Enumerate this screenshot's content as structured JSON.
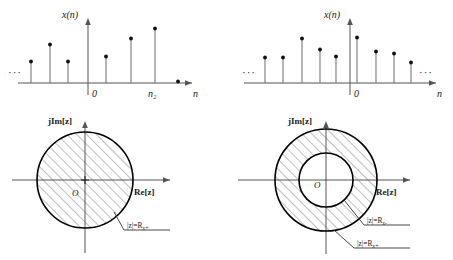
{
  "figure": {
    "panels": [
      {
        "id": "left-sequence",
        "kind": "stem-plot",
        "y_axis_label": "x(n)",
        "x_axis_label": "n",
        "origin_label": "0",
        "marker_label": "n₂",
        "left_ellipsis": "···",
        "right_ellipsis": "",
        "samples": [
          {
            "n": -5,
            "value": 0.34
          },
          {
            "n": -4,
            "value": 0.62
          },
          {
            "n": -3,
            "value": 0.34
          },
          {
            "n": -1,
            "value": 0.0
          },
          {
            "n": 1,
            "value": 0.42
          },
          {
            "n": 2,
            "value": 0.72
          },
          {
            "n": 3,
            "value": 0.88
          },
          {
            "n": 4,
            "value": 0.03
          }
        ]
      },
      {
        "id": "left-roc",
        "kind": "z-plane",
        "imag_axis_label": "jIm[z]",
        "real_axis_label": "Re[z]",
        "origin_label": "O",
        "region_type": "disk",
        "boundary_labels": [
          {
            "text": "|z|=R",
            "sub": "x+"
          }
        ]
      },
      {
        "id": "right-sequence",
        "kind": "stem-plot",
        "y_axis_label": "x(n)",
        "x_axis_label": "n",
        "origin_label": "0",
        "marker_label": "",
        "left_ellipsis": "···",
        "right_ellipsis": "···",
        "samples": [
          {
            "n": -6,
            "value": 0.44
          },
          {
            "n": -5,
            "value": 0.44
          },
          {
            "n": -4,
            "value": 0.78
          },
          {
            "n": -3,
            "value": 0.58
          },
          {
            "n": -2,
            "value": 0.46
          },
          {
            "n": 0,
            "value": 0.8
          },
          {
            "n": 1,
            "value": 0.56
          },
          {
            "n": 2,
            "value": 0.52
          },
          {
            "n": 3,
            "value": 0.36
          }
        ]
      },
      {
        "id": "right-roc",
        "kind": "z-plane",
        "imag_axis_label": "jIm[z]",
        "real_axis_label": "Re[z]",
        "origin_label": "O",
        "region_type": "annulus",
        "boundary_labels": [
          {
            "text": "|z|=R",
            "sub": "x-"
          },
          {
            "text": "|z|=R",
            "sub": "x+"
          }
        ]
      }
    ]
  },
  "colors": {
    "stroke_dark": "#000000",
    "axis_gray": "#555555",
    "stem_gray": "#777777",
    "hatch_gray": "#4a4a4a",
    "background": "#ffffff"
  }
}
